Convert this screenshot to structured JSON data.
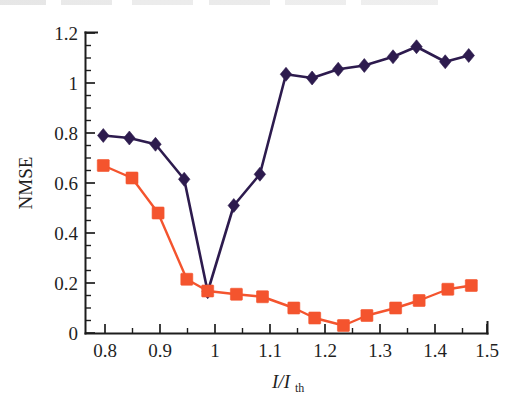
{
  "chart_data": {
    "type": "line",
    "title": "",
    "subtitle": "",
    "xlabel": "I/I_th",
    "xlabel_main": "I/I",
    "xlabel_sub": "th",
    "ylabel": "NMSE",
    "xlim": [
      0.765,
      1.535
    ],
    "ylim": [
      0,
      1.2
    ],
    "grid": false,
    "legend": "none",
    "x_ticks_major": [
      "0.8",
      "0.9",
      "1",
      "1.1",
      "1.2",
      "1.3",
      "1.4",
      "1.5"
    ],
    "x_ticks_major_values": [
      0.8,
      0.9,
      1.0,
      1.1,
      1.2,
      1.3,
      1.4,
      1.5
    ],
    "x_ticks_minor_values": [
      0.85,
      0.95,
      1.05,
      1.15,
      1.25,
      1.35,
      1.45
    ],
    "y_ticks_major": [
      "0",
      "0.2",
      "0.4",
      "0.6",
      "0.8",
      "1",
      "1.2"
    ],
    "y_ticks_major_values": [
      0,
      0.2,
      0.4,
      0.6,
      0.8,
      1.0,
      1.2
    ],
    "y_ticks_minor_values": [
      0.05,
      0.1,
      0.15,
      0.25,
      0.3,
      0.35,
      0.45,
      0.5,
      0.55,
      0.65,
      0.7,
      0.75,
      0.85,
      0.9,
      0.95,
      1.05,
      1.1,
      1.15
    ],
    "series": [
      {
        "name": "navy-diamond-series",
        "marker": "diamond",
        "color": "#2d1b4e",
        "x": [
          0.8,
          0.85,
          0.9,
          0.955,
          1.0,
          1.05,
          1.1,
          1.15,
          1.2,
          1.25,
          1.3,
          1.355,
          1.4,
          1.455,
          1.5
        ],
        "values": [
          0.79,
          0.78,
          0.755,
          0.615,
          0.165,
          0.51,
          0.635,
          1.035,
          1.02,
          1.055,
          1.07,
          1.105,
          1.145,
          1.085,
          1.11
        ]
      },
      {
        "name": "orange-square-series",
        "marker": "square",
        "color": "#f4542e",
        "x": [
          0.8,
          0.855,
          0.905,
          0.96,
          1.0,
          1.055,
          1.105,
          1.165,
          1.205,
          1.26,
          1.305,
          1.36,
          1.405,
          1.46,
          1.505
        ],
        "values": [
          0.67,
          0.62,
          0.48,
          0.215,
          0.168,
          0.155,
          0.145,
          0.1,
          0.06,
          0.03,
          0.07,
          0.1,
          0.13,
          0.175,
          0.19
        ]
      }
    ]
  },
  "axes": {
    "y_label_text": "NMSE"
  }
}
